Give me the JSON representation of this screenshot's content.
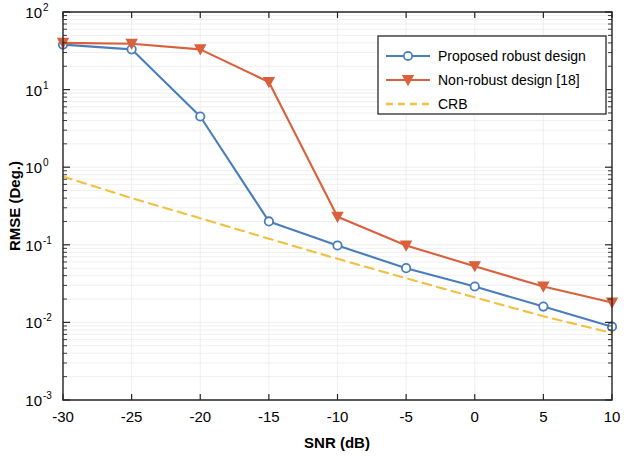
{
  "figure": {
    "width": 628,
    "height": 462,
    "background": "#ffffff"
  },
  "legend": {
    "position": "top-right",
    "items": [
      {
        "label": "Proposed  robust design",
        "color": "#4a7ebb",
        "marker": "circle",
        "style": "solid"
      },
      {
        "label": "Non-robust design [18]",
        "color": "#d9603b",
        "marker": "triangle-down",
        "style": "solid"
      },
      {
        "label": "CRB",
        "color": "#f0c040",
        "marker": "none",
        "style": "dashed"
      }
    ]
  },
  "axes": {
    "x_label": "SNR (dB)",
    "y_label": "RMSE (Deg.)",
    "x_ticks": [
      "-30",
      "-25",
      "-20",
      "-15",
      "-10",
      "-5",
      "0",
      "5",
      "10"
    ],
    "y_ticks": [
      {
        "base": "10",
        "exp": "2"
      },
      {
        "base": "10",
        "exp": "1"
      },
      {
        "base": "10",
        "exp": "0"
      },
      {
        "base": "10",
        "exp": "-1"
      },
      {
        "base": "10",
        "exp": "-2"
      },
      {
        "base": "10",
        "exp": "-3"
      }
    ]
  },
  "chart_data": {
    "type": "line",
    "title": "",
    "xlabel": "SNR (dB)",
    "ylabel": "RMSE (Deg.)",
    "xlim": [
      -30,
      10
    ],
    "ylim": [
      0.001,
      100
    ],
    "yscale": "log",
    "xscale": "linear",
    "grid": true,
    "legend_position": "top-right",
    "x": [
      -30,
      -25,
      -20,
      -15,
      -10,
      -5,
      0,
      5,
      10
    ],
    "series": [
      {
        "name": "Proposed  robust design",
        "color": "#4a7ebb",
        "marker": "circle",
        "linestyle": "solid",
        "values": [
          38,
          33,
          4.5,
          0.2,
          0.098,
          0.05,
          0.029,
          0.016,
          0.0088
        ]
      },
      {
        "name": "Non-robust design [18]",
        "color": "#d9603b",
        "marker": "triangle-down",
        "linestyle": "solid",
        "values": [
          40,
          39,
          33,
          12.5,
          0.23,
          0.098,
          0.053,
          0.029,
          0.018
        ]
      },
      {
        "name": "CRB",
        "color": "#f0c040",
        "marker": "none",
        "linestyle": "dashed",
        "values": [
          0.76,
          0.4,
          0.22,
          0.12,
          0.066,
          0.037,
          0.021,
          0.012,
          0.0073
        ]
      }
    ]
  }
}
